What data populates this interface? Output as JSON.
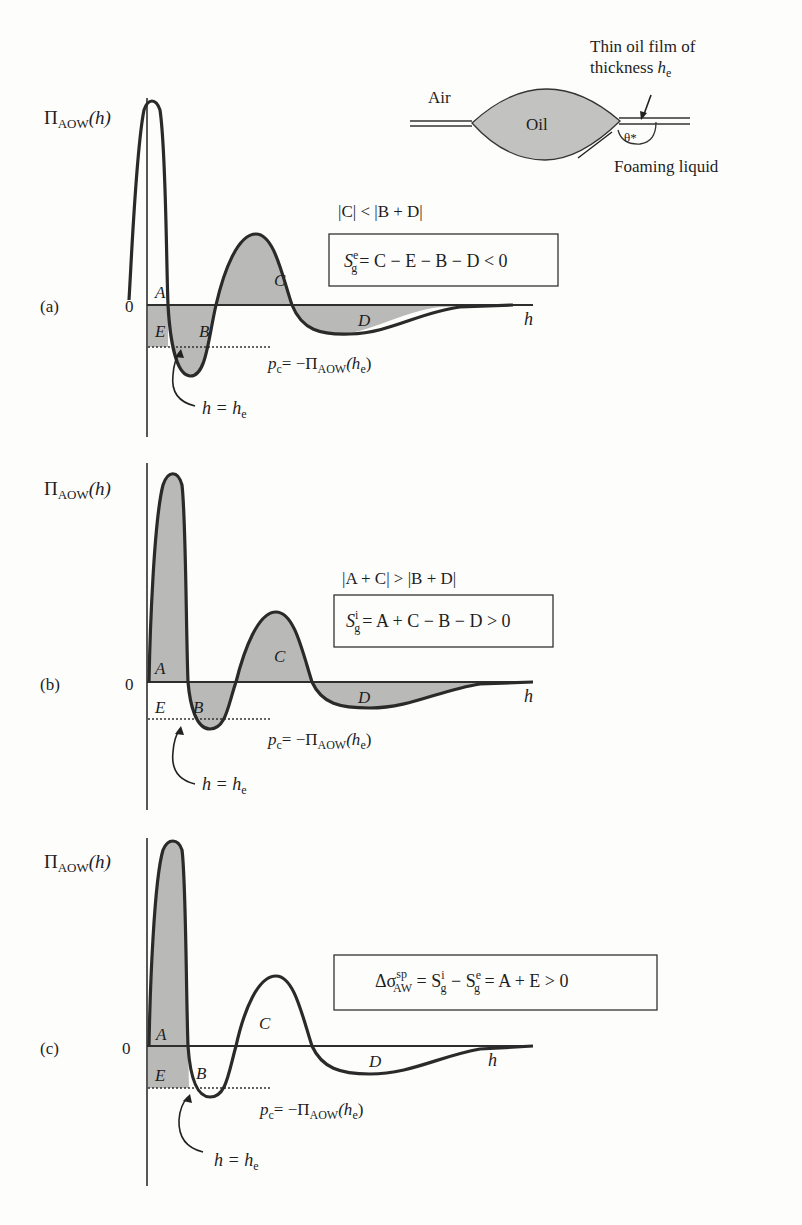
{
  "figure": {
    "inset": {
      "air_label": "Air",
      "oil_label": "Oil",
      "film_label_line1": "Thin oil film of",
      "film_label_line2": "thickness ",
      "film_symbol": "h",
      "film_subscript": "e",
      "angle_label": "θ*",
      "liquid_label": "Foaming liquid"
    },
    "panels": [
      {
        "id": "a",
        "panel_label": "(a)",
        "y_axis_label": "Π",
        "y_axis_sub": "AOW",
        "y_axis_arg": "(h)",
        "zero_label": "0",
        "x_axis_label": "h",
        "condition": "|C| < |B + D|",
        "formula_S": "S",
        "formula_sup": "e",
        "formula_sub": "g",
        "formula_rhs": "= C − E − B − D < 0",
        "regions": [
          "A",
          "E",
          "B",
          "C",
          "D"
        ],
        "pc_label_p": "p",
        "pc_label_sub": "c",
        "pc_label_rhs": "= −Π",
        "pc_label_sub2": "AOW",
        "pc_label_arg": "(h",
        "pc_label_arg_sub": "e",
        "pc_label_close": ")",
        "he_label": "h = h",
        "he_sub": "e"
      },
      {
        "id": "b",
        "panel_label": "(b)",
        "y_axis_label": "Π",
        "y_axis_sub": "AOW",
        "y_axis_arg": "(h)",
        "zero_label": "0",
        "x_axis_label": "h",
        "condition": "|A + C| > |B + D|",
        "formula_S": "S",
        "formula_sup": "i",
        "formula_sub": "g",
        "formula_rhs": "= A + C − B − D > 0",
        "regions": [
          "A",
          "E",
          "B",
          "C",
          "D"
        ],
        "pc_label_p": "p",
        "pc_label_sub": "c",
        "pc_label_rhs": "= −Π",
        "pc_label_sub2": "AOW",
        "pc_label_arg": "(h",
        "pc_label_arg_sub": "e",
        "pc_label_close": ")",
        "he_label": "h = h",
        "he_sub": "e"
      },
      {
        "id": "c",
        "panel_label": "(c)",
        "y_axis_label": "Π",
        "y_axis_sub": "AOW",
        "y_axis_arg": "(h)",
        "zero_label": "0",
        "x_axis_label": "h",
        "formula_lhs": "Δσ",
        "formula_sup": "sp",
        "formula_sub": "AW",
        "formula_mid1": " = S",
        "formula_mid1_sup": "i",
        "formula_mid1_sub": "g",
        "formula_mid2": " − S",
        "formula_mid2_sup": "e",
        "formula_mid2_sub": "g",
        "formula_rhs": " = A + E > 0",
        "regions": [
          "A",
          "E",
          "B",
          "C",
          "D"
        ],
        "pc_label_p": "p",
        "pc_label_sub": "c",
        "pc_label_rhs": "= −Π",
        "pc_label_sub2": "AOW",
        "pc_label_arg": "(h",
        "pc_label_arg_sub": "e",
        "pc_label_close": ")",
        "he_label": "h = h",
        "he_sub": "e"
      }
    ],
    "colors": {
      "fill_gray": "#b9b9b7",
      "curve": "#2a2a2a",
      "axis": "#2e2e2e",
      "oil_fill": "#c2c2c0"
    }
  }
}
